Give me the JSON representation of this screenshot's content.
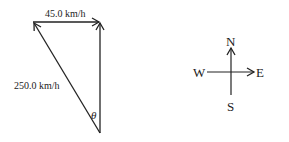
{
  "diagram": {
    "top_vector_label": "45.0 km/h",
    "diagonal_vector_label": "250.0 km/h",
    "angle_label": "θ",
    "compass": {
      "north": "N",
      "south": "S",
      "east": "E",
      "west": "W"
    }
  },
  "colors": {
    "stroke": "#222222",
    "background": "#ffffff"
  }
}
